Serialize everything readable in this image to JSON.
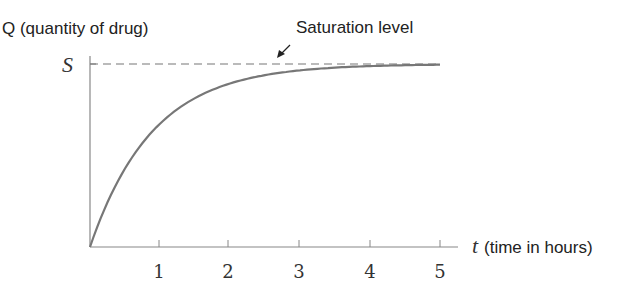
{
  "chart_data": {
    "type": "line",
    "title": "",
    "ylabel": "Q (quantity of drug)",
    "xlabel_var": "t",
    "xlabel": "(time in hours)",
    "x_ticks": [
      "1",
      "2",
      "3",
      "4",
      "5"
    ],
    "y_ticks": [
      "S"
    ],
    "xlim": [
      0,
      5.25
    ],
    "ylim": [
      0,
      1
    ],
    "annotation": "Saturation level",
    "asymptote_label": "S",
    "series": [
      {
        "name": "Q(t) = S(1 - e^{-kt})",
        "x": [
          0,
          0.5,
          1,
          1.5,
          2,
          2.5,
          3,
          3.5,
          4,
          4.5,
          5
        ],
        "y": [
          0,
          0.42,
          0.67,
          0.81,
          0.89,
          0.94,
          0.96,
          0.98,
          0.99,
          0.99,
          1.0
        ]
      }
    ],
    "grid": false
  }
}
